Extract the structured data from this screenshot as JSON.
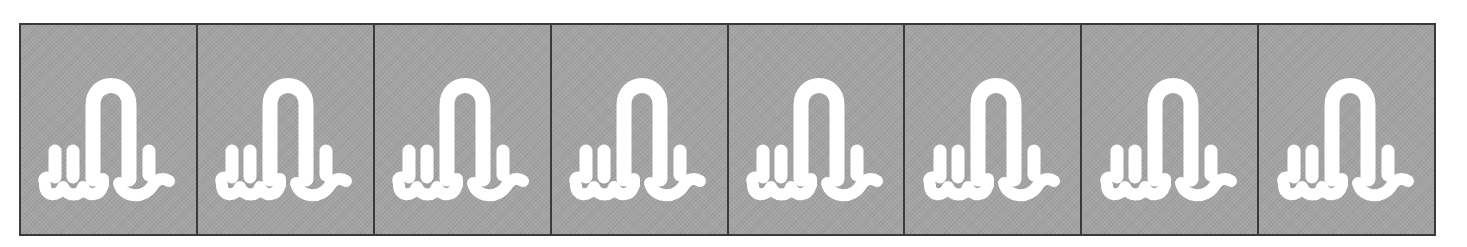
{
  "strip": {
    "tile_count": 8,
    "tile_background": "#a4a4a4",
    "border_color": "#3a3a3a",
    "glyph_color": "#ffffff"
  },
  "tiles": [
    {
      "index": 1,
      "icon": "loop-glyph-icon"
    },
    {
      "index": 2,
      "icon": "loop-glyph-icon"
    },
    {
      "index": 3,
      "icon": "loop-glyph-icon"
    },
    {
      "index": 4,
      "icon": "loop-glyph-icon"
    },
    {
      "index": 5,
      "icon": "loop-glyph-icon"
    },
    {
      "index": 6,
      "icon": "loop-glyph-icon"
    },
    {
      "index": 7,
      "icon": "loop-glyph-icon"
    },
    {
      "index": 8,
      "icon": "loop-glyph-icon"
    }
  ]
}
